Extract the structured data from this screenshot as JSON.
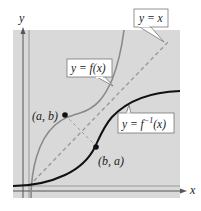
{
  "diagram": {
    "title": "",
    "axes": {
      "x_label": "x",
      "y_label": "y"
    },
    "callouts": {
      "identity": "y = x",
      "function": "y = f(x)",
      "inverse_prefix": "y = f",
      "inverse_sup": "−1",
      "inverse_suffix": "(x)"
    },
    "points": {
      "p1": "(a, b)",
      "p2": "(b, a)"
    },
    "colors": {
      "plot_bg": "#d9d9d9",
      "function_curve": "#8a8a8a",
      "inverse_curve": "#111111",
      "identity_line": "#9a9a9a",
      "axis": "#555555"
    }
  }
}
